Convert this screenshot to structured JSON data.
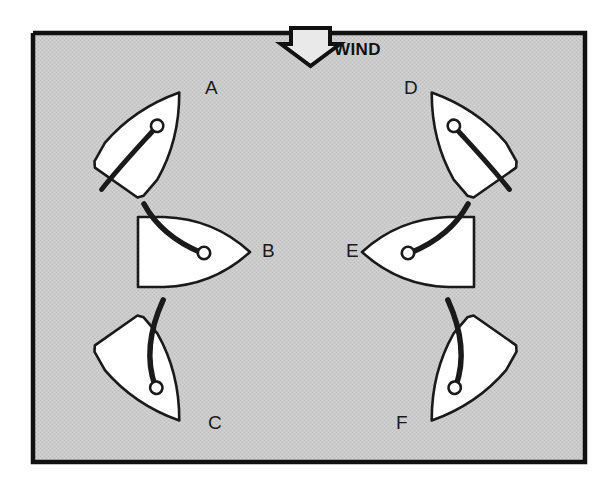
{
  "figure": {
    "background_color": "#c9c9c9",
    "page_color": "#ffffff",
    "border_color": "#111111",
    "hull_fill": "#ffffff",
    "line_color": "#1a1a1a",
    "frame": {
      "x": 33,
      "y": 33,
      "width": 552,
      "height": 429
    }
  },
  "wind": {
    "label": "WIND",
    "direction": "down",
    "arrow_name": "wind-arrow",
    "label_x": 334,
    "label_y": 55
  },
  "boats": [
    {
      "id": "A",
      "label": "A",
      "label_x": 205,
      "label_y": 94,
      "heading_deg": 35,
      "center_x": 146,
      "center_y": 140,
      "description": "close hauled starboard tack, bow up-right"
    },
    {
      "id": "B",
      "label": "B",
      "label_x": 262,
      "label_y": 257,
      "heading_deg": 90,
      "center_x": 188,
      "center_y": 252,
      "description": "beam reach starboard tack, bow right"
    },
    {
      "id": "C",
      "label": "C",
      "label_x": 208,
      "label_y": 429,
      "heading_deg": 145,
      "center_x": 146,
      "center_y": 373,
      "description": "broad reach starboard tack, bow down-right"
    },
    {
      "id": "D",
      "label": "D",
      "label_x": 404,
      "label_y": 94,
      "heading_deg": -35,
      "center_x": 465,
      "center_y": 140,
      "description": "close hauled port tack, bow up-left"
    },
    {
      "id": "E",
      "label": "E",
      "label_x": 346,
      "label_y": 257,
      "heading_deg": -90,
      "center_x": 424,
      "center_y": 252,
      "description": "beam reach port tack, bow left"
    },
    {
      "id": "F",
      "label": "F",
      "label_x": 396,
      "label_y": 429,
      "heading_deg": -145,
      "center_x": 465,
      "center_y": 373,
      "description": "broad reach port tack, bow down-left"
    }
  ]
}
